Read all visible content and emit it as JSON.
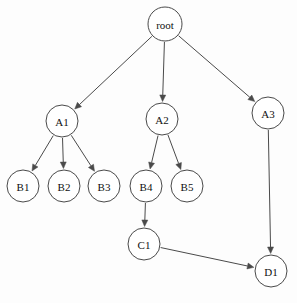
{
  "diagram": {
    "type": "node-link-tree",
    "background_color": "#fdfdfd",
    "stroke_color": "#4a4a4a",
    "node_fill_color": "#ffffff",
    "label_color": "#111111",
    "node_radius": 16,
    "nodes": [
      {
        "id": "root",
        "label": "root",
        "cx": 165,
        "cy": 24,
        "r": 17
      },
      {
        "id": "A1",
        "label": "A1",
        "cx": 62,
        "cy": 121,
        "r": 16
      },
      {
        "id": "A2",
        "label": "A2",
        "cx": 162,
        "cy": 119,
        "r": 16
      },
      {
        "id": "A3",
        "label": "A3",
        "cx": 268,
        "cy": 113,
        "r": 16
      },
      {
        "id": "B1",
        "label": "B1",
        "cx": 23,
        "cy": 186,
        "r": 16
      },
      {
        "id": "B2",
        "label": "B2",
        "cx": 64,
        "cy": 186,
        "r": 16
      },
      {
        "id": "B3",
        "label": "B3",
        "cx": 104,
        "cy": 186,
        "r": 16
      },
      {
        "id": "B4",
        "label": "B4",
        "cx": 146,
        "cy": 186,
        "r": 16
      },
      {
        "id": "B5",
        "label": "B5",
        "cx": 187,
        "cy": 186,
        "r": 16
      },
      {
        "id": "C1",
        "label": "C1",
        "cx": 144,
        "cy": 244,
        "r": 16
      },
      {
        "id": "D1",
        "label": "D1",
        "cx": 271,
        "cy": 271,
        "r": 16
      }
    ],
    "edges": [
      {
        "from": "root",
        "to": "A1",
        "directed": true
      },
      {
        "from": "root",
        "to": "A2",
        "directed": true
      },
      {
        "from": "root",
        "to": "A3",
        "directed": true
      },
      {
        "from": "A1",
        "to": "B1",
        "directed": true
      },
      {
        "from": "A1",
        "to": "B2",
        "directed": true
      },
      {
        "from": "A1",
        "to": "B3",
        "directed": true
      },
      {
        "from": "A2",
        "to": "B4",
        "directed": true
      },
      {
        "from": "A2",
        "to": "B5",
        "directed": true
      },
      {
        "from": "B4",
        "to": "C1",
        "directed": true
      },
      {
        "from": "C1",
        "to": "D1",
        "directed": true
      },
      {
        "from": "A3",
        "to": "D1",
        "directed": true
      }
    ]
  }
}
